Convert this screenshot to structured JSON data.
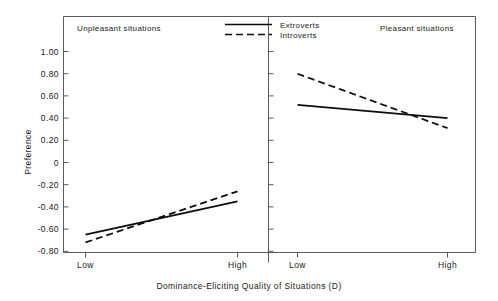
{
  "chart_data": {
    "type": "line",
    "title": "",
    "xlabel": "Dominance-Eliciting Quality of Situations (D)",
    "ylabel": "Preference",
    "ylim": [
      -0.9,
      1.1
    ],
    "ytick_labels": [
      "1.00",
      "0.80",
      "0.60",
      "0.40",
      "0.20",
      "0",
      "-0.20",
      "-0.40",
      "-0.60",
      "-0.80"
    ],
    "ytick_values": [
      1.0,
      0.8,
      0.6,
      0.4,
      0.2,
      0,
      -0.2,
      -0.4,
      -0.6,
      -0.8
    ],
    "grid": false,
    "legend_position": "top-center",
    "legend": [
      "Extroverts",
      "Introverts"
    ],
    "panels": [
      {
        "name": "Unpleasant situations",
        "categories": [
          "Low",
          "High"
        ],
        "series": [
          {
            "name": "Extroverts",
            "style": "solid",
            "values": [
              -0.65,
              -0.35
            ]
          },
          {
            "name": "Introverts",
            "style": "dashed",
            "values": [
              -0.72,
              -0.26
            ]
          }
        ]
      },
      {
        "name": "Pleasant situations",
        "categories": [
          "Low",
          "High"
        ],
        "series": [
          {
            "name": "Extroverts",
            "style": "solid",
            "values": [
              0.52,
              0.4
            ]
          },
          {
            "name": "Introverts",
            "style": "dashed",
            "values": [
              0.8,
              0.31
            ]
          }
        ]
      }
    ]
  },
  "axis": {
    "y_title": "Preference",
    "x_title": "Dominance-Eliciting Quality of Situations (D)",
    "y_ticks": {
      "t0": "1.00",
      "t1": "0.80",
      "t2": "0.60",
      "t3": "0.40",
      "t4": "0.20",
      "t5": "0",
      "t6": "-0.20",
      "t7": "-0.40",
      "t8": "-0.60",
      "t9": "-0.80"
    },
    "x_ticks": {
      "left_low": "Low",
      "left_high": "High",
      "right_low": "Low",
      "right_high": "High"
    }
  },
  "panels": {
    "left_title": "Unpleasant situations",
    "right_title": "Pleasant situations"
  },
  "legend": {
    "extroverts": "Extroverts",
    "introverts": "Introverts"
  },
  "colors": {
    "line": "#0d0d0d",
    "frame": "#4a4a4a",
    "text": "#1a1a1a",
    "background": "#ffffff"
  }
}
